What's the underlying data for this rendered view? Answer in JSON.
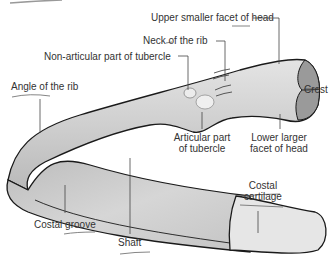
{
  "diagram": {
    "labels": {
      "upper_facet": "Upper smaller facet of head",
      "neck": "Neck of the rib",
      "non_articular": "Non-articular part of tubercle",
      "crest": "Crest",
      "angle": "Angle of the rib",
      "articular_line1": "Articular part",
      "articular_line2": "of tubercle",
      "lower_facet_line1": "Lower larger",
      "lower_facet_line2": "facet of head",
      "costal_cartilage_line1": "Costal",
      "costal_cartilage_line2": "cartilage",
      "costal_groove": "Costal groove",
      "shaft": "Shaft"
    },
    "colors": {
      "bone_fill": "#c8c8c8",
      "bone_light": "#e2e2e2",
      "cartilage_fill": "#e6e6e6",
      "head_fill": "#9a9a9a",
      "outline": "#1a1a1a",
      "leader": "#444444",
      "text": "#333333"
    }
  }
}
